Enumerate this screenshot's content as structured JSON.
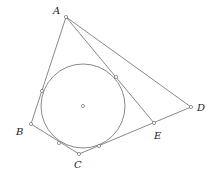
{
  "diagram": {
    "type": "geometry",
    "points": {
      "A": {
        "label": "A",
        "x": 66,
        "y": 17,
        "lx": 53,
        "ly": 14
      },
      "B": {
        "label": "B",
        "x": 31,
        "y": 124,
        "lx": 16,
        "ly": 135
      },
      "C": {
        "label": "C",
        "x": 79,
        "y": 154,
        "lx": 74,
        "ly": 168
      },
      "D": {
        "label": "D",
        "x": 191,
        "y": 107,
        "lx": 197,
        "ly": 111
      },
      "E": {
        "label": "E",
        "x": 154,
        "y": 123,
        "lx": 154,
        "ly": 139
      }
    },
    "incircle": {
      "cx": 83,
      "cy": 106,
      "r": 42
    },
    "tangent_points": [
      {
        "x": 42,
        "y": 91
      },
      {
        "x": 116,
        "y": 77
      },
      {
        "x": 59,
        "y": 143
      },
      {
        "x": 99,
        "y": 146
      }
    ],
    "segments": [
      [
        "A",
        "B"
      ],
      [
        "B",
        "C"
      ],
      [
        "C",
        "E"
      ],
      [
        "E",
        "D"
      ],
      [
        "A",
        "D"
      ],
      [
        "A",
        "E"
      ]
    ],
    "colors": {
      "stroke": "#6b6b6b",
      "label": "#222222"
    }
  }
}
